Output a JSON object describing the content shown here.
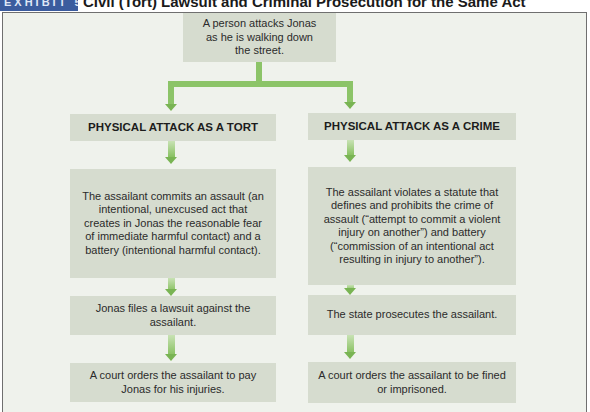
{
  "exhibit": {
    "label": "EXHIBIT 5-2",
    "title": "Civil (Tort) Lawsuit and Criminal Prosecution for the Same Act"
  },
  "colors": {
    "exhibit_label_bg": "#3b5c9e",
    "frame_bg": "#eff2ec",
    "box_bg": "#d6dccf",
    "arrow_green": "#8cc468"
  },
  "diagram": {
    "root": "A person attacks Jonas as he is walking down the street.",
    "tort": {
      "heading": "PHYSICAL ATTACK AS A TORT",
      "steps": [
        "The assailant commits an assault (an intentional, unexcused act that creates in Jonas the reasonable fear of immediate harmful contact) and a battery (intentional harmful contact).",
        "Jonas files a lawsuit against the assailant.",
        "A court orders the assailant to pay Jonas for his injuries."
      ]
    },
    "crime": {
      "heading": "PHYSICAL ATTACK AS A CRIME",
      "steps": [
        "The assailant violates a statute that defines and prohibits the crime of assault (“attempt to commit a violent injury on another”) and battery (“commission of an intentional act resulting in injury to another”).",
        "The state prosecutes the assailant.",
        "A court orders the assailant to be fined or imprisoned."
      ]
    }
  }
}
